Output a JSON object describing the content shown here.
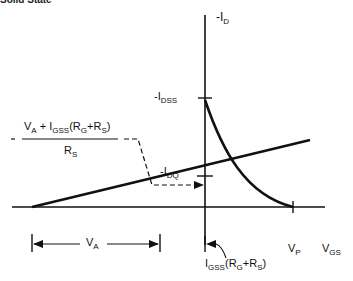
{
  "heading": "Solid State",
  "axes": {
    "y_label_prefix": "-I",
    "y_label_sub": "D",
    "x_label_prefix": "V",
    "x_label_sub": "GS"
  },
  "labels": {
    "idss_prefix": "-I",
    "idss_sub": "DSS",
    "idq_prefix": "-I",
    "idq_sub": "DQ",
    "vp_prefix": "V",
    "vp_sub": "P",
    "va_prefix": "V",
    "va_sub": "A",
    "offset_prefix": "I",
    "offset_sub": "GSS",
    "offset_rest_open": "(R",
    "offset_rg_sub": "G",
    "offset_plus": "+R",
    "offset_rs_sub": "S",
    "offset_close": ")"
  },
  "formula": {
    "numerator": {
      "va_prefix": "V",
      "va_sub": "A",
      "plus": " + I",
      "igss_sub": "GSS",
      "open": "(R",
      "rg_sub": "G",
      "plus2": "+R",
      "rs_sub": "S",
      "close": ")"
    },
    "denominator": {
      "r_prefix": "R",
      "r_sub": "S"
    },
    "leading_dash": "-"
  },
  "colors": {
    "line": "#111111",
    "background": "#ffffff"
  }
}
